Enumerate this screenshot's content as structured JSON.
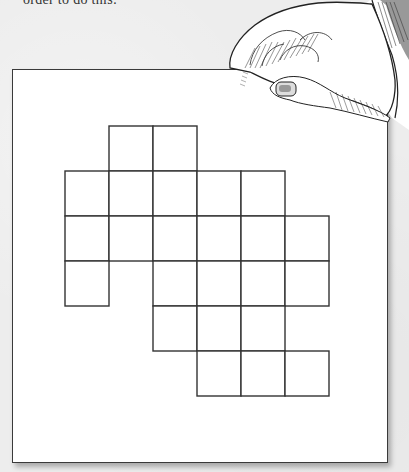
{
  "caption": {
    "text": "order to do this:"
  },
  "paper": {
    "color": "#ffffff",
    "border_color": "#3a3a3a"
  },
  "illustration": {
    "subject": "hand-holding-paper-icon",
    "description": "Engraved-style hand pinching the top-right corner of a sheet of paper"
  },
  "grid": {
    "cell_size": 44,
    "origin_x": 65,
    "origin_y": 126,
    "columns": 6,
    "rows": 6,
    "line_color": "#333333",
    "cells_by_row": [
      [
        1,
        2
      ],
      [
        0,
        1,
        2,
        3,
        4
      ],
      [
        0,
        1,
        2,
        3,
        4,
        5
      ],
      [
        0,
        2,
        3,
        4,
        5
      ],
      [
        2,
        3,
        4
      ],
      [
        3,
        4,
        5
      ]
    ],
    "total_cells": 25
  }
}
